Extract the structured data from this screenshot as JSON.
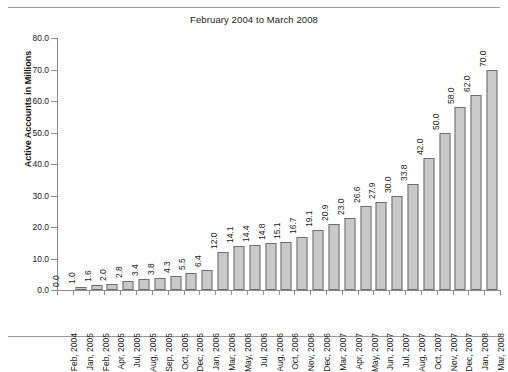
{
  "chart_data": {
    "type": "bar",
    "title": "February 2004 to March 2008",
    "xlabel": "",
    "ylabel": "Active Accounts in Millions",
    "ylim": [
      0,
      80
    ],
    "ytick_labels": [
      "0.0",
      "10.0",
      "20.0",
      "30.0",
      "40.0",
      "50.0",
      "60.0",
      "70.0",
      "80.0"
    ],
    "ytick_values": [
      0,
      10,
      20,
      30,
      40,
      50,
      60,
      70,
      80
    ],
    "grid": false,
    "legend": "none",
    "bar_fill": "#c9c9c9",
    "bar_edge": "#6e6e6e",
    "categories": [
      "Feb, 2004",
      "Jan, 2005",
      "Feb, 2005",
      "Apr, 2005",
      "Jul, 2005",
      "Aug, 2005",
      "Sep, 2005",
      "Oct, 2005",
      "Dec, 2005",
      "Jan, 2006",
      "Mar, 2006",
      "May, 2006",
      "Jul, 2006",
      "Aug, 2006",
      "Oct, 2006",
      "Nov, 2006",
      "Dec, 2006",
      "Mar, 2007",
      "Apr, 2007",
      "May, 2007",
      "Jun, 2007",
      "Jul, 2007",
      "Aug, 2007",
      "Oct, 2007",
      "Nov, 2007",
      "Dec, 2007",
      "Jan, 2008",
      "Mar, 2008"
    ],
    "values": [
      0.0,
      1.0,
      1.6,
      2.0,
      2.8,
      3.4,
      3.8,
      4.3,
      5.5,
      6.4,
      12.0,
      14.1,
      14.4,
      14.8,
      15.1,
      16.7,
      19.1,
      20.9,
      23.0,
      26.6,
      27.9,
      30.0,
      33.8,
      42.0,
      50.0,
      58.0,
      62.0,
      70.0
    ],
    "value_labels": [
      "0.0",
      "1.0",
      "1.6",
      "2.0",
      "2.8",
      "3.4",
      "3.8",
      "4.3",
      "5.5",
      "6.4",
      "12.0",
      "14.1",
      "14.4",
      "14.8",
      "15.1",
      "16.7",
      "19.1",
      "20.9",
      "23.0",
      "26.6",
      "27.9",
      "30.0",
      "33.8",
      "42.0",
      "50.0",
      "58.0",
      "62.0",
      "70.0"
    ]
  }
}
